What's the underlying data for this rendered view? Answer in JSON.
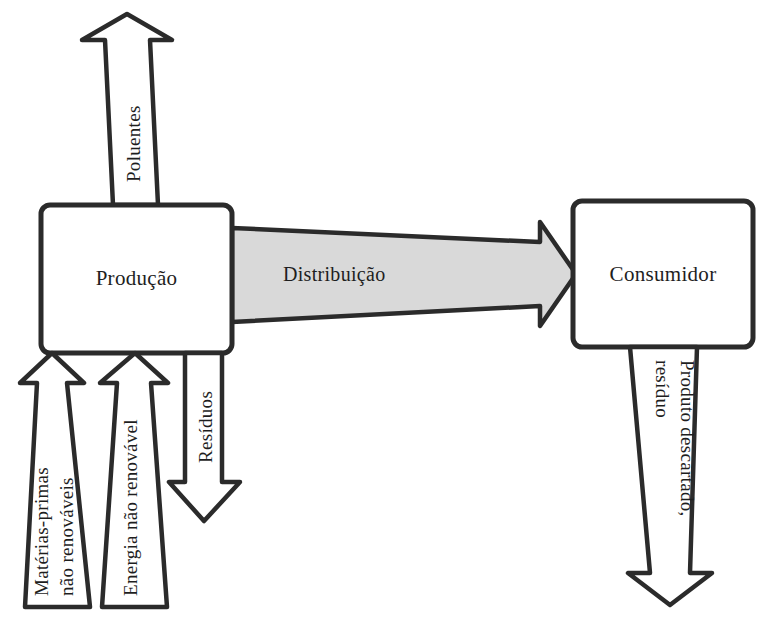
{
  "diagram": {
    "background_color": "#ffffff",
    "line_color": "#2b2b2b",
    "fill_color": "#d9d9d9",
    "text_color": "#1e1e1e",
    "nodes": [
      {
        "id": "producao",
        "label": "Produção"
      },
      {
        "id": "consumidor",
        "label": "Consumidor"
      }
    ],
    "flows": [
      {
        "id": "poluentes",
        "label": "Poluentes",
        "direction": "up",
        "from": "producao",
        "to": "ambiente"
      },
      {
        "id": "distribuicao",
        "label": "Distribuição",
        "direction": "right",
        "from": "producao",
        "to": "consumidor",
        "filled": "true"
      },
      {
        "id": "residuos",
        "label": "Resíduos",
        "direction": "down",
        "from": "producao",
        "to": "ambiente"
      },
      {
        "id": "materias-primas",
        "label_line_1": "Matérias-primas",
        "label_line_2": "não renováveis",
        "direction": "up",
        "from": "ambiente",
        "to": "producao"
      },
      {
        "id": "energia",
        "label_line_1": "Energia não renovável",
        "label_line_2": "",
        "direction": "up",
        "from": "ambiente",
        "to": "producao"
      },
      {
        "id": "produto-descartado",
        "label_line_1": "Produto descartado,",
        "label_line_2": "resíduo",
        "direction": "down",
        "from": "consumidor",
        "to": "ambiente"
      }
    ]
  }
}
